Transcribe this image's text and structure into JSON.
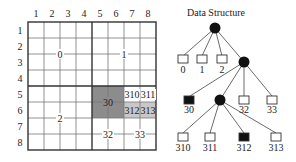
{
  "grid": {
    "col_labels": [
      "1",
      "2",
      "3",
      "4",
      "5",
      "6",
      "7",
      "8"
    ],
    "row_labels": [
      "1",
      "2",
      "3",
      "4",
      "5",
      "6",
      "7",
      "8"
    ],
    "region_labels": {
      "q0": "0",
      "q1": "1",
      "q2": "2",
      "q30": "30",
      "q310": "310",
      "q311": "311",
      "q312": "312",
      "q313": "313",
      "q32": "32",
      "q33": "33"
    },
    "colors": {
      "dark_shade": "#8c8c8c",
      "light_shade": "#c8c8c8",
      "line": "#555555"
    }
  },
  "tree": {
    "title": "Data Structure",
    "level1": [
      "0",
      "1",
      "2"
    ],
    "level2": [
      "30",
      "32",
      "33"
    ],
    "level3": [
      "310",
      "311",
      "312",
      "313"
    ]
  }
}
